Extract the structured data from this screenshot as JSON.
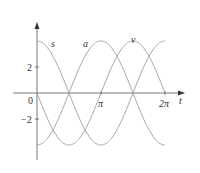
{
  "chart_data": {
    "type": "line",
    "title": "",
    "xlabel": "t",
    "ylabel": "",
    "xlim": [
      0,
      6.2832
    ],
    "ylim": [
      -4,
      4
    ],
    "grid": false,
    "x_ticks": [
      "0",
      "π",
      "2π"
    ],
    "y_ticks": [
      "2",
      "-2"
    ],
    "series": [
      {
        "name": "s",
        "formula": "4cos(t)",
        "x": [
          0,
          1.5708,
          3.1416,
          4.7124,
          6.2832
        ],
        "values": [
          4,
          0,
          -4,
          0,
          4
        ]
      },
      {
        "name": "a",
        "formula": "-4cos(t)",
        "x": [
          0,
          1.5708,
          3.1416,
          4.7124,
          6.2832
        ],
        "values": [
          -4,
          0,
          4,
          0,
          -4
        ]
      },
      {
        "name": "v",
        "formula": "-4sin(t)",
        "x": [
          0,
          1.5708,
          3.1416,
          4.7124,
          6.2832
        ],
        "values": [
          0,
          -4,
          0,
          4,
          0
        ]
      }
    ],
    "labels": {
      "s": "s",
      "a": "a",
      "v": "v",
      "t": "t",
      "zero": "0",
      "pi": "π",
      "two_pi": "2π",
      "y_pos": "2",
      "y_neg": "−2"
    }
  }
}
